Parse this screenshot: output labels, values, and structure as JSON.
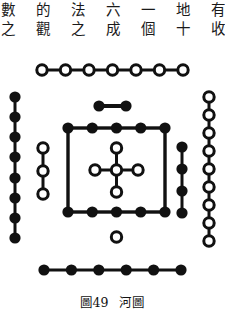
{
  "page": {
    "text_lines": [
      "數 的 法 六 一 地 有 有 ， 特",
      "之 觀 之 成 個 十 收 發 必 之"
    ]
  },
  "figure": {
    "caption_number": "圖49",
    "caption_title": "河圖",
    "colors": {
      "stroke": "#111111",
      "fill_black": "#111111",
      "fill_white": "#ffffff",
      "background": "#ffffff"
    },
    "groups": [
      {
        "id": "top-outer",
        "name": "south-seven-yang",
        "count": 7,
        "dot_style": "open",
        "orientation": "horizontal",
        "position": "top"
      },
      {
        "id": "top-inner",
        "name": "south-two-yin",
        "count": 2,
        "dot_style": "filled",
        "orientation": "horizontal",
        "position": "top-inner"
      },
      {
        "id": "left-outer",
        "name": "east-eight-yin",
        "count": 8,
        "dot_style": "filled",
        "orientation": "vertical",
        "position": "left"
      },
      {
        "id": "left-inner",
        "name": "east-three-yang",
        "count": 3,
        "dot_style": "open",
        "orientation": "vertical",
        "position": "left-inner"
      },
      {
        "id": "right-outer",
        "name": "west-nine-yang",
        "count": 9,
        "dot_style": "open",
        "orientation": "vertical",
        "position": "right"
      },
      {
        "id": "right-inner",
        "name": "west-four-yin",
        "count": 4,
        "dot_style": "filled",
        "orientation": "vertical",
        "position": "right-inner"
      },
      {
        "id": "bottom-outer",
        "name": "north-six-yin",
        "count": 6,
        "dot_style": "filled",
        "orientation": "horizontal",
        "position": "bottom"
      },
      {
        "id": "bottom-inner",
        "name": "north-one-yang",
        "count": 1,
        "dot_style": "open",
        "orientation": "single",
        "position": "bottom-inner"
      },
      {
        "id": "center-cross",
        "name": "center-five-yang",
        "count": 5,
        "dot_style": "open",
        "orientation": "cross",
        "position": "center"
      },
      {
        "id": "center-square",
        "name": "center-ten-yin",
        "count": 10,
        "dot_style": "filled",
        "orientation": "square",
        "position": "center"
      }
    ]
  }
}
